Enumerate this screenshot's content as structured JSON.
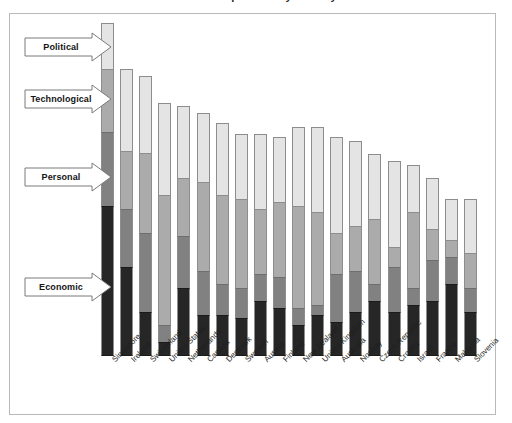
{
  "figure": {
    "title_sliver": "Index components by country",
    "frame_color": "#b9b9b9"
  },
  "legend": {
    "callouts": [
      {
        "label": "Political",
        "color": "#e4e4e4",
        "key": "political"
      },
      {
        "label": "Technological",
        "color": "#ababab",
        "key": "technological"
      },
      {
        "label": "Personal",
        "color": "#818181",
        "key": "personal"
      },
      {
        "label": "Economic",
        "color": "#262626",
        "key": "economic"
      }
    ]
  },
  "chart_data": {
    "type": "bar",
    "stacked": true,
    "title": "Index components by country",
    "xlabel": "",
    "ylabel": "",
    "grid": false,
    "legend_position": "left-callouts",
    "ylim": [
      0,
      100
    ],
    "categories": [
      "Singapore",
      "Ireland",
      "Switzerland",
      "United States",
      "Netherlands",
      "Canada",
      "Denmark",
      "Sweden",
      "Austria",
      "Finland",
      "New Zealand",
      "United Kingdom",
      "Australia",
      "Norway",
      "Czech Republic",
      "Croatia",
      "Israel",
      "France",
      "Malaysia",
      "Slovenia"
    ],
    "series": [
      {
        "name": "Economic",
        "color": "#262626",
        "values": [
          44.0,
          26.0,
          13.0,
          4.0,
          20.0,
          12.0,
          12.0,
          11.0,
          16.0,
          14.0,
          9.0,
          12.0,
          10.0,
          13.0,
          16.0,
          13.0,
          15.0,
          16.0,
          21.0,
          13.0
        ]
      },
      {
        "name": "Personal",
        "color": "#818181",
        "values": [
          21.5,
          17.0,
          23.0,
          5.0,
          15.0,
          13.0,
          9.0,
          9.0,
          8.0,
          9.0,
          5.0,
          3.0,
          14.0,
          12.0,
          5.0,
          13.0,
          5.0,
          12.0,
          8.0,
          7.0
        ]
      },
      {
        "name": "Technological",
        "color": "#ababab",
        "values": [
          18.5,
          17.0,
          23.5,
          38.0,
          17.0,
          26.0,
          26.0,
          26.0,
          19.0,
          22.0,
          30.0,
          27.0,
          12.0,
          13.0,
          19.0,
          6.0,
          22.0,
          9.0,
          5.0,
          10.0
        ]
      },
      {
        "name": "Political",
        "color": "#e4e4e4",
        "values": [
          13.5,
          24.0,
          22.5,
          27.0,
          21.0,
          20.0,
          21.0,
          19.0,
          22.0,
          19.0,
          23.0,
          25.0,
          28.0,
          25.0,
          19.0,
          25.0,
          14.0,
          15.0,
          12.0,
          16.0
        ]
      }
    ],
    "totals": [
      97.5,
      84.0,
      82.0,
      74.0,
      73.0,
      71.0,
      68.0,
      65.0,
      65.0,
      64.0,
      67.0,
      67.0,
      64.0,
      63.0,
      59.0,
      57.0,
      56.0,
      52.0,
      46.0,
      46.0
    ]
  }
}
